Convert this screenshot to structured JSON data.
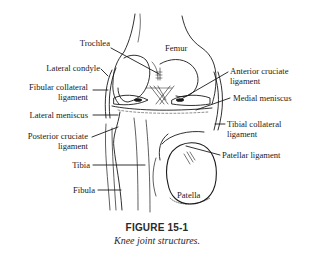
{
  "figure": {
    "number_label": "FIGURE 15-1",
    "caption": "Knee joint structures."
  },
  "labels": {
    "femur": "Femur",
    "trochlea": "Trochlea",
    "lateral_condyle": "Lateral condyle",
    "fibular_collateral_1": "Fibular collateral",
    "fibular_collateral_2": "ligament",
    "lateral_meniscus": "Lateral meniscus",
    "posterior_cruciate_1": "Posterior cruciate",
    "posterior_cruciate_2": "ligament",
    "tibia": "Tibia",
    "fibula": "Fibula",
    "anterior_cruciate_1": "Anterior cruciate",
    "anterior_cruciate_2": "ligament",
    "medial_meniscus": "Medial meniscus",
    "tibial_collateral_1": "Tibial collateral",
    "tibial_collateral_2": "ligament",
    "patellar_ligament": "Patellar ligament",
    "patella": "Patella"
  }
}
